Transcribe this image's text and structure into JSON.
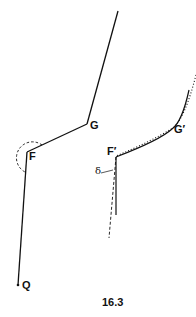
{
  "figure": {
    "caption": "16.3",
    "left_diagram": {
      "labels": {
        "G": "G",
        "F": "F",
        "Q": "Q"
      }
    },
    "right_diagram": {
      "labels": {
        "G_prime": "G′",
        "F_prime": "F′",
        "delta": "δ"
      }
    },
    "colors": {
      "line": "#111111",
      "background": "#ffffff"
    }
  }
}
